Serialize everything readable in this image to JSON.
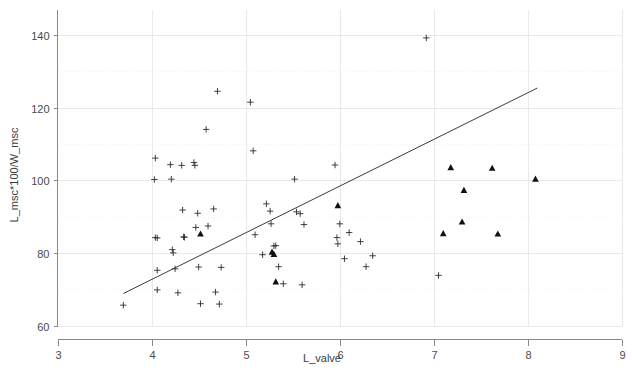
{
  "chart_data": {
    "type": "scatter",
    "title": "",
    "xlabel": "L_valve",
    "ylabel": "L_msc*100/W_msc",
    "xlim": [
      3,
      9
    ],
    "ylim": [
      60,
      145
    ],
    "x_ticks": [
      3,
      4,
      5,
      6,
      7,
      8,
      9
    ],
    "y_ticks": [
      60,
      80,
      100,
      120,
      140
    ],
    "y_minor_gridlines": [
      70,
      90,
      110,
      130
    ],
    "grid": true,
    "legend": "none",
    "series": [
      {
        "name": "plus-markers",
        "marker": "plus",
        "color": "#2d2d2d",
        "points": [
          [
            3.7,
            65.6
          ],
          [
            4.03,
            100.2
          ],
          [
            4.04,
            106.1
          ],
          [
            4.04,
            84.2
          ],
          [
            4.06,
            84.1
          ],
          [
            4.06,
            75.2
          ],
          [
            4.06,
            69.8
          ],
          [
            4.2,
            104.3
          ],
          [
            4.21,
            100.3
          ],
          [
            4.22,
            80.9
          ],
          [
            4.23,
            80.0
          ],
          [
            4.25,
            75.6
          ],
          [
            4.28,
            69.0
          ],
          [
            4.32,
            104.1
          ],
          [
            4.33,
            91.8
          ],
          [
            4.34,
            84.4
          ],
          [
            4.35,
            84.3
          ],
          [
            4.45,
            104.9
          ],
          [
            4.46,
            104.1
          ],
          [
            4.47,
            87.0
          ],
          [
            4.49,
            90.9
          ],
          [
            4.5,
            76.1
          ],
          [
            4.52,
            66.0
          ],
          [
            4.58,
            114.0
          ],
          [
            4.6,
            87.4
          ],
          [
            4.66,
            92.1
          ],
          [
            4.68,
            69.2
          ],
          [
            4.7,
            124.5
          ],
          [
            4.72,
            65.9
          ],
          [
            4.74,
            76.0
          ],
          [
            5.05,
            121.5
          ],
          [
            5.08,
            108.1
          ],
          [
            5.1,
            85.0
          ],
          [
            5.18,
            79.5
          ],
          [
            5.22,
            93.5
          ],
          [
            5.26,
            91.5
          ],
          [
            5.27,
            88.0
          ],
          [
            5.3,
            81.9
          ],
          [
            5.32,
            82.0
          ],
          [
            5.35,
            76.2
          ],
          [
            5.4,
            71.5
          ],
          [
            5.52,
            100.3
          ],
          [
            5.54,
            91.3
          ],
          [
            5.58,
            90.8
          ],
          [
            5.6,
            71.2
          ],
          [
            5.62,
            87.8
          ],
          [
            5.95,
            104.2
          ],
          [
            5.97,
            84.2
          ],
          [
            5.98,
            82.5
          ],
          [
            6.0,
            88.0
          ],
          [
            6.05,
            78.4
          ],
          [
            6.1,
            85.6
          ],
          [
            6.22,
            83.1
          ],
          [
            6.28,
            76.2
          ],
          [
            6.35,
            79.2
          ],
          [
            6.92,
            139.2
          ],
          [
            7.05,
            73.8
          ]
        ]
      },
      {
        "name": "triangle-markers",
        "marker": "triangle",
        "color": "#101010",
        "points": [
          [
            4.52,
            85.2
          ],
          [
            5.28,
            80.2
          ],
          [
            5.3,
            79.6
          ],
          [
            5.32,
            72.0
          ],
          [
            5.98,
            93.0
          ],
          [
            7.1,
            85.3
          ],
          [
            7.18,
            103.5
          ],
          [
            7.3,
            88.5
          ],
          [
            7.32,
            97.2
          ],
          [
            7.62,
            103.3
          ],
          [
            7.68,
            85.2
          ],
          [
            8.08,
            100.3
          ]
        ]
      }
    ],
    "fit_line": {
      "name": "regression-line",
      "x_start": 3.7,
      "y_start": 68.8,
      "x_end": 8.1,
      "y_end": 125.4,
      "color": "#3b3b3b"
    }
  },
  "axes": {
    "x_tick_labels": [
      "3",
      "4",
      "5",
      "6",
      "7",
      "8",
      "9"
    ],
    "y_tick_labels": [
      "60",
      "80",
      "100",
      "120",
      "140"
    ]
  }
}
